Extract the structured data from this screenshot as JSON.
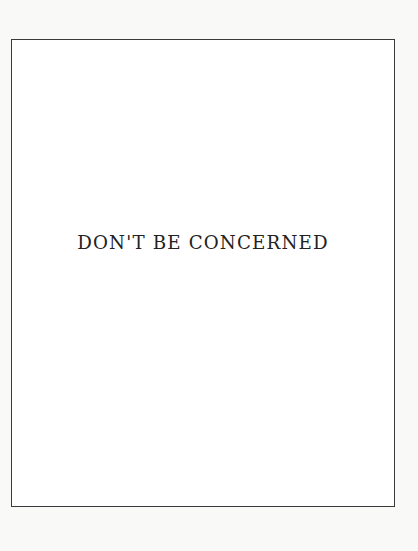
{
  "page": {
    "title": "DON'T BE CONCERNED",
    "colors": {
      "background": "#f9f9f8",
      "frame_border": "#3a3a3a",
      "text": "#222222"
    }
  }
}
